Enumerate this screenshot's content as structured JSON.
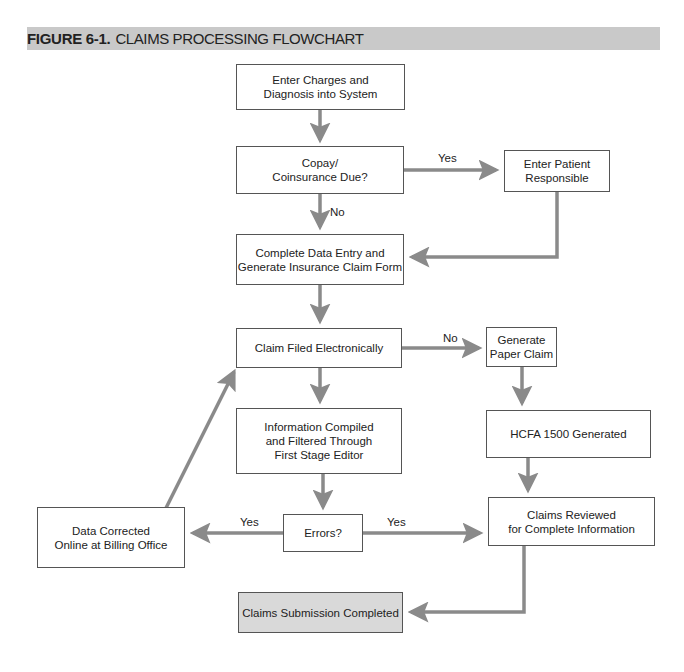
{
  "header": {
    "figure_number": "FIGURE 6-1.",
    "title": "CLAIMS PROCESSING FLOWCHART",
    "background_color": "#c9c9c9"
  },
  "nodes": {
    "enter_charges": "Enter Charges and\nDiagnosis into System",
    "copay_due": "Copay/\nCoinsurance Due?",
    "enter_patient_responsible": "Enter Patient\nResponsible",
    "complete_data_entry": "Complete Data Entry and\nGenerate Insurance Claim Form",
    "claim_filed_electronically": "Claim Filed Electronically",
    "generate_paper_claim": "Generate\nPaper Claim",
    "information_compiled": "Information Compiled\nand Filtered Through\nFirst Stage Editor",
    "hcfa_generated": "HCFA 1500 Generated",
    "errors": "Errors?",
    "data_corrected": "Data Corrected\nOnline at Billing Office",
    "claims_reviewed": "Claims Reviewed\nfor Complete Information",
    "claims_submission_completed": "Claims Submission Completed"
  },
  "edge_labels": {
    "copay_yes": "Yes",
    "copay_no": "No",
    "electronic_no": "No",
    "errors_yes_left": "Yes",
    "errors_yes_right": "Yes"
  },
  "colors": {
    "arrow": "#8a8a8a",
    "box_border": "#555555",
    "final_box_fill": "#d9d9d9"
  }
}
